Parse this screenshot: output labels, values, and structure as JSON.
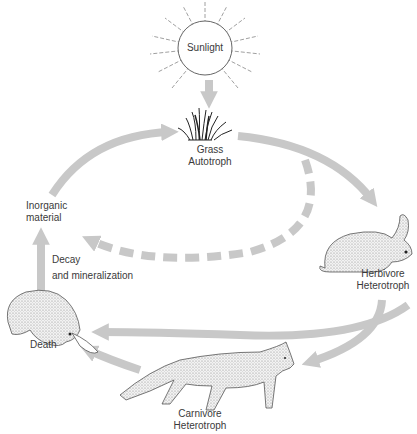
{
  "diagram": {
    "type": "ecological cycle (energy/matter flow)",
    "colors": {
      "arrow": "#c8c8c8",
      "line": "#555555",
      "text": "#3a3a3a",
      "background": "#ffffff"
    },
    "nodes": {
      "sun": {
        "label": "Sunlight",
        "icon": "sun-icon"
      },
      "grass": {
        "line1": "Grass",
        "line2": "Autotroph",
        "icon": "grass-icon"
      },
      "herbivore": {
        "line1": "Herbivore",
        "line2": "Heterotroph",
        "icon": "rabbit-icon"
      },
      "carnivore": {
        "line1": "Carnivore",
        "line2": "Heterotroph",
        "icon": "fox-icon"
      },
      "death": {
        "label": "Death",
        "icon": "dead-rabbit-icon"
      },
      "inorganic": {
        "line1": "Inorganic",
        "line2": "material"
      },
      "decay": {
        "line1": "Decay",
        "line2": "and mineralization"
      }
    },
    "edges": [
      {
        "from": "Sunlight",
        "to": "Grass",
        "style": "solid"
      },
      {
        "from": "Grass",
        "to": "Herbivore",
        "style": "solid"
      },
      {
        "from": "Grass",
        "to": "Inorganic material",
        "style": "dashed"
      },
      {
        "from": "Herbivore",
        "to": "Death",
        "style": "solid"
      },
      {
        "from": "Herbivore",
        "to": "Carnivore",
        "style": "solid"
      },
      {
        "from": "Carnivore",
        "to": "Death",
        "style": "solid"
      },
      {
        "from": "Death",
        "to": "Inorganic material",
        "style": "solid"
      },
      {
        "from": "Inorganic material",
        "to": "Grass",
        "style": "solid"
      }
    ]
  }
}
